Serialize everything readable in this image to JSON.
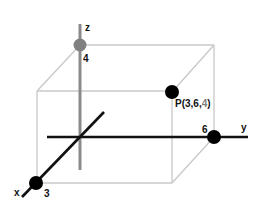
{
  "colors": {
    "background": "#ffffff",
    "box_edge": "#c8c8c8",
    "z_axis": "#8a8a8a",
    "z_point": "#808080",
    "axis_black": "#111111",
    "point_black": "#000000",
    "label": "#111111",
    "label_gray": "#808080"
  },
  "axes": {
    "x": {
      "label": "x",
      "tick_label": "3"
    },
    "y": {
      "label": "y",
      "tick_label": "6"
    },
    "z": {
      "label": "z",
      "tick_label": "4"
    }
  },
  "point": {
    "prefix": "P(3,6,",
    "z_value": "4",
    "suffix": ")"
  }
}
